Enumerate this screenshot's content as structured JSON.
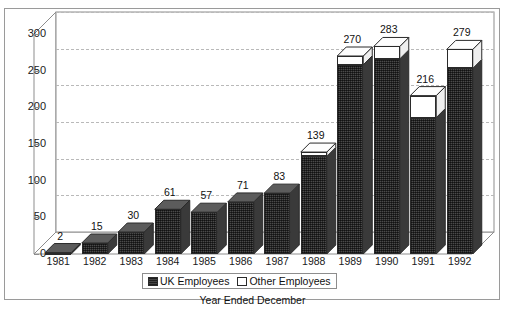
{
  "chart_data": {
    "type": "bar",
    "subtype": "stacked-3d-column",
    "title": "",
    "xlabel": "Year Ended December",
    "ylabel": "",
    "ylim": [
      0,
      300
    ],
    "ytick_step": 50,
    "yticks": [
      "0",
      "50",
      "100",
      "150",
      "200",
      "250",
      "300"
    ],
    "grid": true,
    "grid_style": "dashed horizontal",
    "legend_position": "bottom-center",
    "categories": [
      "1981",
      "1982",
      "1983",
      "1984",
      "1985",
      "1986",
      "1987",
      "1988",
      "1989",
      "1990",
      "1991",
      "1992"
    ],
    "totals": [
      2,
      15,
      30,
      61,
      57,
      71,
      83,
      139,
      270,
      283,
      216,
      279
    ],
    "data_labels": [
      "2",
      "15",
      "30",
      "61",
      "57",
      "71",
      "83",
      "139",
      "270",
      "283",
      "216",
      "279"
    ],
    "series": [
      {
        "name": "UK Employees",
        "color": "#454545",
        "values": [
          2,
          15,
          30,
          61,
          57,
          71,
          83,
          133,
          258,
          266,
          186,
          253
        ]
      },
      {
        "name": "Other Employees",
        "color": "#ffffff",
        "values": [
          0,
          0,
          0,
          0,
          0,
          0,
          0,
          6,
          12,
          17,
          30,
          26
        ]
      }
    ]
  },
  "legend": {
    "items": [
      {
        "label": "UK Employees",
        "swatch": "uk"
      },
      {
        "label": "Other Employees",
        "swatch": "other"
      }
    ]
  },
  "axis": {
    "x_title": "Year Ended December"
  }
}
